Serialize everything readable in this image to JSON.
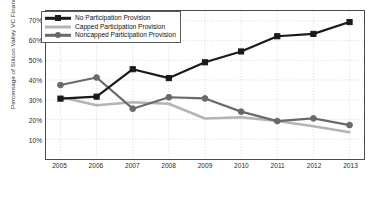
{
  "chart_data": {
    "type": "line",
    "title": "",
    "xlabel": "",
    "ylabel": "Percentage of Silicon Valley VC Financings",
    "categories": [
      "2005",
      "2006",
      "2007",
      "2008",
      "2009",
      "2010",
      "2011",
      "2012",
      "2013"
    ],
    "x": [
      2005,
      2006,
      2007,
      2008,
      2009,
      2010,
      2011,
      2012,
      2013
    ],
    "xlim": [
      2004.6,
      2013.4
    ],
    "ylim": [
      0,
      75
    ],
    "ytick_values": [
      10,
      20,
      30,
      40,
      50,
      60,
      70
    ],
    "ytick_labels": [
      "10%",
      "20%",
      "30%",
      "40%",
      "50%",
      "60%",
      "70%"
    ],
    "grid": true,
    "legend_position": "top-left",
    "series": [
      {
        "name": "No Participation Provision",
        "color": "#1a1a1a",
        "marker": "square",
        "values": [
          30.6,
          31.6,
          45.5,
          41.0,
          49.0,
          54.5,
          62.2,
          63.4,
          69.4
        ]
      },
      {
        "name": "Capped Participation Provision",
        "color": "#b4b4b4",
        "marker": "none",
        "values": [
          31.4,
          27.2,
          28.8,
          28.0,
          20.5,
          21.2,
          19.3,
          16.6,
          13.6
        ]
      },
      {
        "name": "Noncapped Participation Provision",
        "color": "#6a6a6a",
        "marker": "circle",
        "values": [
          37.5,
          41.3,
          25.5,
          31.3,
          30.7,
          24.0,
          19.2,
          20.6,
          17.2
        ]
      }
    ]
  },
  "legend": {
    "entries": [
      "No Participation Provision",
      "Capped Participation Provision",
      "Noncapped Participation Provision"
    ]
  },
  "axes": {
    "y_title": "Percentage of Silicon Valley VC Financings"
  }
}
